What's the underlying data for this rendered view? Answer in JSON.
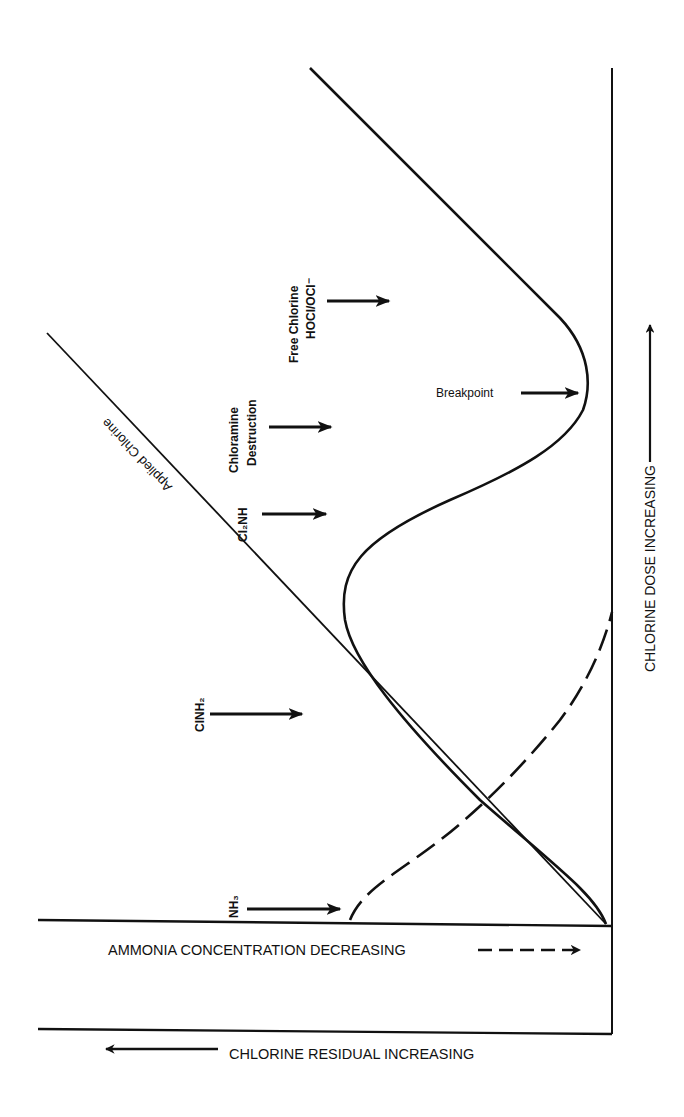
{
  "diagram": {
    "type": "breakpoint-chlorination-curve",
    "orientation": "rotated 90 degrees counterclockwise",
    "axes": {
      "dose_label": "CHLORINE DOSE INCREASING",
      "ammonia_label": "AMMONIA CONCENTRATION DECREASING",
      "residual_label": "CHLORINE RESIDUAL INCREASING"
    },
    "lines": {
      "applied_chlorine": "Applied Chlorine"
    },
    "zones": [
      {
        "id": "nh3",
        "label": "NH₃"
      },
      {
        "id": "clnh2",
        "label": "ClNH₂"
      },
      {
        "id": "cl2nh",
        "label": "Cl₂NH"
      },
      {
        "id": "chloramine_destruction",
        "line1": "Chloramine",
        "line2": "Destruction"
      },
      {
        "id": "free_chlorine",
        "line1": "Free Chlorine",
        "line2": "HOCl/OCl⁻"
      }
    ],
    "annotations": {
      "breakpoint": "Breakpoint"
    },
    "colors": {
      "ink": "#111111",
      "background": "#ffffff"
    }
  }
}
